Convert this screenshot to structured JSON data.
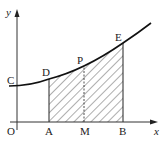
{
  "diagram": {
    "axes": {
      "x_label": "x",
      "y_label": "y",
      "origin_label": "O"
    },
    "points": {
      "C": "C",
      "D": "D",
      "P": "P",
      "E": "E",
      "A": "A",
      "M": "M",
      "B": "B"
    },
    "colors": {
      "stroke": "#222222",
      "hatch": "#333333",
      "background": "#ffffff"
    }
  }
}
